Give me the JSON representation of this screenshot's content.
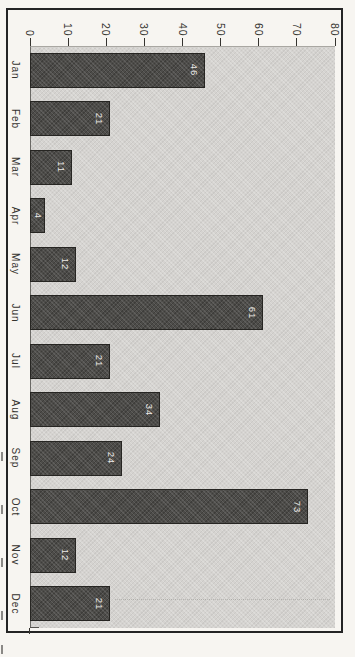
{
  "page": {
    "background": "#f7f5f1"
  },
  "frame": {
    "border_color": "#242424"
  },
  "chart_data": {
    "type": "bar",
    "orientation": "horizontal bars (column chart rotated 90 degrees clockwise on page, all text sideways)",
    "title": "",
    "xlabel": "",
    "ylabel": "",
    "categories": [
      "Jan",
      "Feb",
      "Mar",
      "Apr",
      "May",
      "Jun",
      "Jul",
      "Aug",
      "Sep",
      "Oct",
      "Nov",
      "Dec"
    ],
    "values": [
      46,
      21,
      11,
      4,
      12,
      61,
      21,
      34,
      24,
      73,
      12,
      21
    ],
    "bar_value_labels": [
      "46",
      "21",
      "11",
      "4",
      "12",
      "61",
      "21",
      "34",
      "24",
      "73",
      "12",
      "21"
    ],
    "value_axis": {
      "position": "top",
      "min": 0,
      "max": 80,
      "step": 10,
      "ticks": [
        "0",
        "10",
        "20",
        "30",
        "40",
        "50",
        "60",
        "70",
        "80"
      ]
    },
    "grid": "off",
    "legend": "none",
    "colors": {
      "bar_fill": "#4d4c49",
      "bar_border": "#262522",
      "plot_background": "#d5d3d0",
      "bar_label_text": "#eceae7",
      "axis_text": "#35332f",
      "frame_border": "#242424",
      "page_background": "#f7f5f1"
    }
  }
}
